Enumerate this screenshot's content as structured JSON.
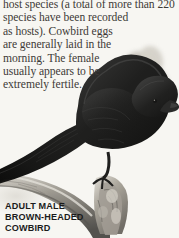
{
  "page": {
    "width": 179,
    "height": 238,
    "background_color": "#f7f6f3"
  },
  "body_text": {
    "text_color": "#3d3a37",
    "lines": [
      "host species (a total of more than 220",
      "species have been recorded",
      "as hosts). Cowbird eggs",
      "are generally laid in the",
      "morning. The female",
      "usually appears to be",
      "extremely fertile."
    ]
  },
  "caption": {
    "text_color": "#1b1b1b",
    "lines": [
      "ADULT MALE",
      "BROWN-HEADED",
      "COWBIRD"
    ]
  },
  "illustration": {
    "subject": "brown-headed-cowbird-perched-on-branch",
    "colors": {
      "body_dark": "#111111",
      "body_mid": "#2b2b2b",
      "head_brown": "#6e6054",
      "head_light": "#b4aa9d",
      "branch_gray": "#8e8b84",
      "branch_light": "#c9c6bf",
      "branch_dark": "#5a5752"
    }
  }
}
